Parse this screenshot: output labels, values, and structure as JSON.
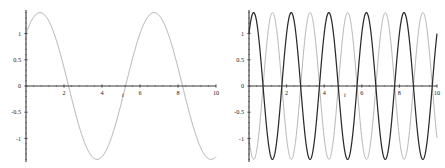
{
  "figure": {
    "background_color": "#ffffff",
    "panel_count": 2
  },
  "chart_data": [
    {
      "id": "left-plot",
      "type": "line",
      "title": "",
      "subtitle": "",
      "xlabel": "t",
      "ylabel": "",
      "xlim": [
        0,
        10
      ],
      "ylim": [
        -1.45,
        1.45
      ],
      "grid": false,
      "legend": null,
      "legend_position": "none",
      "xticks": [
        2,
        4,
        6,
        8,
        10
      ],
      "xticklabels": [
        "2",
        "4",
        "6",
        "8",
        "10"
      ],
      "xminor_tick_step": 0.4,
      "yticks": [
        -1,
        -0.5,
        0,
        0.5,
        1
      ],
      "yticklabels": [
        "-1",
        "-0.5",
        "0",
        "0.5",
        "1"
      ],
      "yminor_tick_step": 0.1,
      "axis_color": "#3a3a3a",
      "series": [
        {
          "name": "slow-oscillation",
          "color": "#8c8c8c",
          "line_width": 0.7,
          "amplitude": 1.4,
          "period": 6.0,
          "phase_deg": 45.6,
          "samples_x": [
            0,
            0.25,
            0.5,
            0.75,
            1,
            1.25,
            1.5,
            1.75,
            2,
            2.25,
            2.5,
            2.75,
            3,
            3.25,
            3.5,
            3.75,
            4,
            4.25,
            4.5,
            4.75,
            5,
            5.25,
            5.5,
            5.75,
            6,
            6.25,
            6.5,
            6.75,
            7,
            7.25,
            7.5,
            7.75,
            8,
            8.25,
            8.5,
            8.75,
            9,
            9.25,
            9.5,
            9.75,
            10
          ],
          "samples_y": [
            1.0,
            1.26,
            1.39,
            1.4,
            1.28,
            1.04,
            0.71,
            0.31,
            -0.11,
            -0.52,
            -0.88,
            -1.16,
            -1.35,
            -1.4,
            -1.35,
            -1.16,
            -0.88,
            -0.52,
            -0.11,
            0.31,
            0.71,
            1.04,
            1.28,
            1.4,
            1.4,
            1.26,
            1.0,
            0.63,
            0.2,
            -0.24,
            -0.66,
            -1.0,
            -1.25,
            -1.38,
            -1.4,
            -1.29,
            -1.06,
            -0.74,
            -0.34,
            0.09,
            0.5
          ]
        }
      ]
    },
    {
      "id": "right-plot",
      "type": "line",
      "title": "",
      "subtitle": "",
      "xlabel": "t",
      "ylabel": "",
      "xlim": [
        0,
        10
      ],
      "ylim": [
        -1.45,
        1.45
      ],
      "grid": false,
      "legend": null,
      "legend_position": "none",
      "xticks": [
        2,
        4,
        6,
        8,
        10
      ],
      "xticklabels": [
        "2",
        "4",
        "6",
        "8",
        "10"
      ],
      "xminor_tick_step": 0.4,
      "yticks": [
        -1,
        -0.5,
        0,
        0.5,
        1
      ],
      "yticklabels": [
        "-1",
        "-0.5",
        "0",
        "0.5",
        "1"
      ],
      "yminor_tick_step": 0.1,
      "axis_color": "#3a3a3a",
      "series": [
        {
          "name": "fast-oscillation-dark",
          "color": "#2b2b2b",
          "line_width": 1.25,
          "amplitude": 1.4,
          "period": 2.0,
          "phase_deg": 45.6,
          "samples_x": [
            0,
            0.1,
            0.2,
            0.3,
            0.4,
            0.5,
            0.6,
            0.7,
            0.8,
            0.9,
            1.0,
            1.2,
            1.4,
            1.6,
            1.8,
            2.0,
            2.2,
            2.4,
            2.6,
            2.8,
            3.0,
            3.2,
            3.4,
            3.6,
            3.8,
            4.0,
            4.5,
            5.0,
            5.5,
            6.0,
            6.5,
            7.0,
            7.5,
            8.0,
            8.5,
            9.0,
            9.5,
            10.0
          ],
          "samples_y": [
            1.0,
            1.26,
            1.39,
            1.38,
            1.22,
            0.94,
            0.56,
            0.12,
            -0.33,
            -0.75,
            -1.09,
            -1.4,
            -1.28,
            -0.83,
            -0.18,
            0.5,
            1.05,
            1.36,
            1.36,
            1.05,
            0.5,
            -0.18,
            -0.83,
            -1.28,
            -1.4,
            -1.13,
            -0.18,
            1.0,
            0.5,
            -1.13,
            0.18,
            1.0,
            -0.5,
            -1.13,
            0.83,
            1.0,
            -1.05,
            -1.0
          ]
        },
        {
          "name": "fast-oscillation-light",
          "color": "#a0a0a0",
          "line_width": 0.8,
          "amplitude": 1.4,
          "period": 2.0,
          "phase_deg": -135.0,
          "samples_x": [
            0,
            0.1,
            0.2,
            0.3,
            0.4,
            0.5,
            0.6,
            0.7,
            0.8,
            0.9,
            1.0,
            1.2,
            1.4,
            1.6,
            1.8,
            2.0,
            2.5,
            3.0,
            3.5,
            4.0,
            4.5,
            5.0,
            5.5,
            6.0,
            6.5,
            7.0,
            7.5,
            8.0,
            8.5,
            9.0,
            9.5,
            10.0
          ],
          "samples_y": [
            1.0,
            0.6,
            0.1,
            -0.4,
            -0.85,
            -1.18,
            -1.37,
            -1.4,
            -1.25,
            -0.95,
            -0.55,
            0.3,
            1.0,
            1.38,
            1.33,
            0.9,
            -0.7,
            -1.33,
            0.18,
            1.38,
            -0.18,
            -1.38,
            0.55,
            1.33,
            -0.9,
            -1.2,
            1.2,
            1.0,
            -1.3,
            0.6,
            1.3,
            -1.0
          ]
        }
      ]
    }
  ]
}
